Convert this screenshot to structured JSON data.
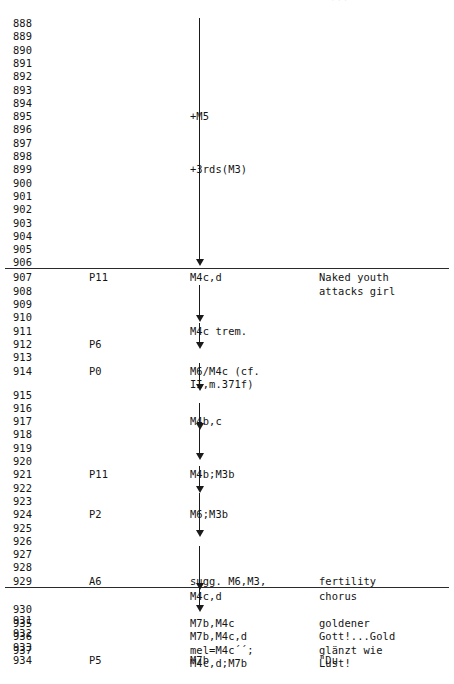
{
  "page": {
    "header_stub": "···",
    "columns": {
      "measure": "measure number",
      "process": "process label",
      "motive": "motive content",
      "description": "dramatic description"
    }
  },
  "rows": [
    {
      "num": "888",
      "proc": "",
      "mot": "",
      "desc": ""
    },
    {
      "num": "889",
      "proc": "",
      "mot": "",
      "desc": ""
    },
    {
      "num": "890",
      "proc": "",
      "mot": "",
      "desc": ""
    },
    {
      "num": "891",
      "proc": "",
      "mot": "",
      "desc": ""
    },
    {
      "num": "892",
      "proc": "",
      "mot": "",
      "desc": ""
    },
    {
      "num": "893",
      "proc": "",
      "mot": "",
      "desc": ""
    },
    {
      "num": "894",
      "proc": "",
      "mot": "",
      "desc": ""
    },
    {
      "num": "895",
      "proc": "",
      "mot": "+M5",
      "desc": ""
    },
    {
      "num": "896",
      "proc": "",
      "mot": "",
      "desc": ""
    },
    {
      "num": "897",
      "proc": "",
      "mot": "",
      "desc": ""
    },
    {
      "num": "898",
      "proc": "",
      "mot": "",
      "desc": ""
    },
    {
      "num": "899",
      "proc": "",
      "mot": "+3rds(M3)",
      "desc": ""
    },
    {
      "num": "900",
      "proc": "",
      "mot": "",
      "desc": ""
    },
    {
      "num": "901",
      "proc": "",
      "mot": "",
      "desc": ""
    },
    {
      "num": "902",
      "proc": "",
      "mot": "",
      "desc": ""
    },
    {
      "num": "903",
      "proc": "",
      "mot": "",
      "desc": ""
    },
    {
      "num": "904",
      "proc": "",
      "mot": "",
      "desc": ""
    },
    {
      "num": "905",
      "proc": "",
      "mot": "",
      "desc": ""
    },
    {
      "num": "906",
      "proc": "",
      "mot": "",
      "desc": ""
    },
    {
      "num": "907",
      "proc": "P11",
      "mot": "M4c,d",
      "desc": "Naked youth"
    },
    {
      "num": "908",
      "proc": "",
      "mot": "",
      "desc": "attacks girl"
    },
    {
      "num": "909",
      "proc": "",
      "mot": "",
      "desc": ""
    },
    {
      "num": "910",
      "proc": "",
      "mot": "",
      "desc": ""
    },
    {
      "num": "911",
      "proc": "",
      "mot": "M4c trem.",
      "desc": ""
    },
    {
      "num": "912",
      "proc": "P6",
      "mot": "",
      "desc": ""
    },
    {
      "num": "913",
      "proc": "",
      "mot": "",
      "desc": ""
    },
    {
      "num": "914",
      "proc": "P0",
      "mot": "M6/M4c (cf.",
      "desc": ""
    },
    {
      "num": "",
      "proc": "",
      "mot": "II,m.371f)",
      "desc": ""
    },
    {
      "num": "915",
      "proc": "",
      "mot": "",
      "desc": ""
    },
    {
      "num": "916",
      "proc": "",
      "mot": "",
      "desc": ""
    },
    {
      "num": "917",
      "proc": "",
      "mot": "M4b,c",
      "desc": ""
    },
    {
      "num": "918",
      "proc": "",
      "mot": "",
      "desc": ""
    },
    {
      "num": "919",
      "proc": "",
      "mot": "",
      "desc": ""
    },
    {
      "num": "920",
      "proc": "",
      "mot": "",
      "desc": ""
    },
    {
      "num": "921",
      "proc": "P11",
      "mot": "M4b;M3b",
      "desc": ""
    },
    {
      "num": "922",
      "proc": "",
      "mot": "",
      "desc": ""
    },
    {
      "num": "923",
      "proc": "",
      "mot": "",
      "desc": ""
    },
    {
      "num": "924",
      "proc": "P2",
      "mot": "M6;M3b",
      "desc": ""
    },
    {
      "num": "925",
      "proc": "",
      "mot": "",
      "desc": ""
    },
    {
      "num": "926",
      "proc": "",
      "mot": "",
      "desc": ""
    },
    {
      "num": "927",
      "proc": "",
      "mot": "",
      "desc": ""
    },
    {
      "num": "928",
      "proc": "",
      "mot": "",
      "desc": ""
    },
    {
      "num": "929",
      "proc": "A6",
      "mot": "sugg. M6,M3,",
      "desc": "fertility"
    },
    {
      "num": "",
      "proc": "",
      "mot": "M4c,d",
      "desc": "chorus"
    },
    {
      "num": "930",
      "proc": "",
      "mot": "",
      "desc": ""
    },
    {
      "num": "931",
      "proc": "",
      "mot": "",
      "desc": ""
    },
    {
      "num": "932",
      "proc": "",
      "mot": "",
      "desc": ""
    },
    {
      "num": "933",
      "proc": "",
      "mot": "",
      "desc": ""
    },
    {
      "num": "934",
      "proc": "P5",
      "mot": "M7b",
      "desc": "\"Du"
    },
    {
      "num": "935",
      "proc": "",
      "mot": "M7b,M4c",
      "desc": "goldener"
    },
    {
      "num": "936",
      "proc": "",
      "mot": "M7b,M4c,d",
      "desc": "Gott!...Gold"
    },
    {
      "num": "937",
      "proc": "",
      "mot": "mel=M4c´´;",
      "desc": "glänzt wie"
    },
    {
      "num": "",
      "proc": "",
      "mot": "M4c,d;M7b",
      "desc": "Lust!"
    }
  ],
  "layout": {
    "row_tops": [
      17.0,
      30.3,
      43.6,
      56.9,
      70.2,
      83.5,
      96.8,
      110.1,
      123.4,
      136.7,
      150.0,
      163.3,
      176.6,
      189.9,
      203.2,
      216.5,
      229.8,
      243.1,
      256.4,
      271.4,
      284.7,
      298.0,
      311.3,
      324.6,
      337.9,
      351.2,
      364.5,
      377.8,
      388.5,
      401.8,
      415.1,
      428.4,
      441.7,
      455.0,
      468.3,
      481.6,
      494.9,
      508.2,
      521.5,
      534.8,
      548.1,
      561.4,
      574.7,
      589.7,
      603.0,
      614.0,
      627.3,
      640.6,
      653.9,
      617.0,
      630.3,
      643.6,
      656.9,
      670.2
    ]
  },
  "rules": [
    {
      "name": "section-rule-top",
      "top": 268.0
    },
    {
      "name": "section-rule-bottom",
      "top": 586.5
    }
  ],
  "connectors": [
    {
      "kind": "vline",
      "top": 18.0,
      "height": 93.0
    },
    {
      "kind": "vline",
      "top": 111.0,
      "height": 49.0
    },
    {
      "kind": "arrow",
      "top": 160.0,
      "height": 100.0
    },
    {
      "kind": "vline",
      "top": 285.0,
      "height": 16.0
    },
    {
      "kind": "arrow",
      "top": 296.0,
      "height": 20.0
    },
    {
      "kind": "arrow",
      "top": 323.0,
      "height": 20.0
    },
    {
      "kind": "arrow",
      "top": 363.0,
      "height": 22.0
    },
    {
      "kind": "arrow",
      "top": 403.0,
      "height": 21.0
    },
    {
      "kind": "arrow",
      "top": 425.0,
      "height": 29.0
    },
    {
      "kind": "arrow",
      "top": 466.0,
      "height": 21.0
    },
    {
      "kind": "arrow",
      "top": 493.0,
      "height": 38.0
    },
    {
      "kind": "arrow",
      "top": 546.0,
      "height": 38.0
    },
    {
      "kind": "arrow",
      "top": 565.0,
      "height": 41.0
    }
  ]
}
